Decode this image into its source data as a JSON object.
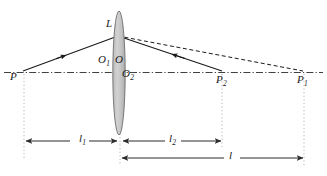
{
  "figure": {
    "type": "optics-ray-diagram",
    "background_color": "#ffffff",
    "line_color": "#1a1a1a",
    "lens_fill_color": "#c9c9c9",
    "lens_stroke_color": "#6e6e6e",
    "guide_color": "#b4b4b4",
    "dimension_color": "#2b2b2b"
  },
  "points": {
    "P": {
      "label": "P",
      "sub": "",
      "x": 22,
      "y": 72
    },
    "L": {
      "label": "L",
      "sub": "",
      "x": 117,
      "y": 38
    },
    "O1": {
      "label": "O",
      "sub": "1",
      "x": 106,
      "y": 62
    },
    "O": {
      "label": "O",
      "sub": "",
      "x": 118,
      "y": 62
    },
    "O2": {
      "label": "O",
      "sub": "2",
      "x": 127,
      "y": 76
    },
    "P2": {
      "label": "P",
      "sub": "2",
      "x": 221,
      "y": 72
    },
    "P1": {
      "label": "P",
      "sub": "1",
      "x": 303,
      "y": 72
    }
  },
  "labels": [
    {
      "name": "point-label-P",
      "text": "P",
      "sub": "",
      "left": 10,
      "top": 71
    },
    {
      "name": "point-label-L",
      "text": "L",
      "sub": "",
      "left": 106,
      "top": 18
    },
    {
      "name": "point-label-O1",
      "text": "O",
      "sub": "1",
      "left": 98,
      "top": 54
    },
    {
      "name": "point-label-O",
      "text": "O",
      "sub": "",
      "left": 115,
      "top": 54
    },
    {
      "name": "point-label-O2",
      "text": "O",
      "sub": "2",
      "left": 122,
      "top": 68
    },
    {
      "name": "point-label-P2",
      "text": "P",
      "sub": "2",
      "left": 216,
      "top": 74
    },
    {
      "name": "point-label-P1",
      "text": "P",
      "sub": "1",
      "left": 297,
      "top": 74
    }
  ],
  "dimensions": [
    {
      "name": "dimension-l1",
      "text": "l",
      "sub": "1",
      "left": 79,
      "top": 133,
      "from_x": 24,
      "to_x": 118,
      "y": 141
    },
    {
      "name": "dimension-l2",
      "text": "l",
      "sub": "2",
      "left": 168,
      "top": 133,
      "from_x": 222,
      "to_x": 120,
      "y": 141
    },
    {
      "name": "dimension-l",
      "text": "l",
      "sub": "",
      "left": 228,
      "top": 150,
      "from_x": 120,
      "to_x": 304,
      "y": 158
    }
  ],
  "axis": {
    "name": "optical-axis",
    "style": "dash-dot",
    "y": 72,
    "x_start": 4,
    "x_end": 323
  },
  "rays": [
    {
      "name": "incident-ray-P-to-L",
      "style": "solid",
      "from": "P",
      "to": "L",
      "arrow": "forward"
    },
    {
      "name": "refracted-ray-L-to-P2",
      "style": "solid",
      "from": "L",
      "to": "P2",
      "arrow": "backward"
    },
    {
      "name": "virtual-ray-L-to-P1",
      "style": "dashed",
      "from": "L",
      "to": "P1",
      "arrow": "none"
    }
  ],
  "guides": [
    {
      "name": "guide-line-P",
      "x": 24,
      "y_top": 74,
      "y_bottom": 160
    },
    {
      "name": "guide-line-P2",
      "x": 222,
      "y_top": 74,
      "y_bottom": 147
    },
    {
      "name": "guide-line-P1",
      "x": 304,
      "y_top": 74,
      "y_bottom": 166
    },
    {
      "name": "guide-line-lens",
      "x": 120,
      "y_top": 76,
      "y_bottom": 164
    }
  ],
  "lens": {
    "name": "converging-lens",
    "center_x": 119,
    "center_y": 73,
    "rx": 6,
    "ry": 62
  }
}
